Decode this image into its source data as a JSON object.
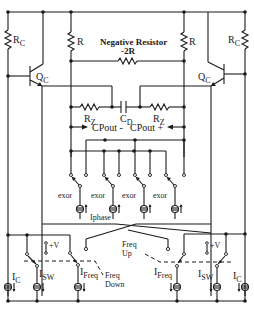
{
  "diagram": {
    "type": "circuit schematic",
    "labels": {
      "rc_left": "R",
      "rc_left_sub": "C",
      "rc_right": "R",
      "rc_right_sub": "C",
      "r_left": "R",
      "r_right": "R",
      "neg_res_title": "Negative Resistor",
      "neg_res_value": "-2R",
      "qc_left": "Q",
      "qc_left_sub": "C",
      "qc_right": "Q",
      "qc_right_sub": "C",
      "rz_left": "R",
      "rz_left_sub": "Z",
      "rz_right": "R",
      "rz_right_sub": "Z",
      "cd": "C",
      "cd_sub": "D",
      "cpout_minus": "CPout -",
      "cpout_plus": "CPout +",
      "exor": [
        "exor",
        "exor",
        "exor",
        "exor"
      ],
      "iphase": "Iphase",
      "freq_up_1": "Freq",
      "freq_up_2": "Up",
      "freq_down_1": "Freq",
      "freq_down_2": "Down",
      "plus_v_left": "+V",
      "plus_v_right": "+V",
      "ic_left": "I",
      "ic_left_sub": "C",
      "isw_left": "I",
      "isw_left_sub": "SW",
      "ifreq_left": "I",
      "ifreq_left_sub": "Freq",
      "ifreq_right": "I",
      "ifreq_right_sub": "Freq",
      "isw_right": "I",
      "isw_right_sub": "SW",
      "ic_right": "I",
      "ic_right_sub": "C"
    }
  }
}
